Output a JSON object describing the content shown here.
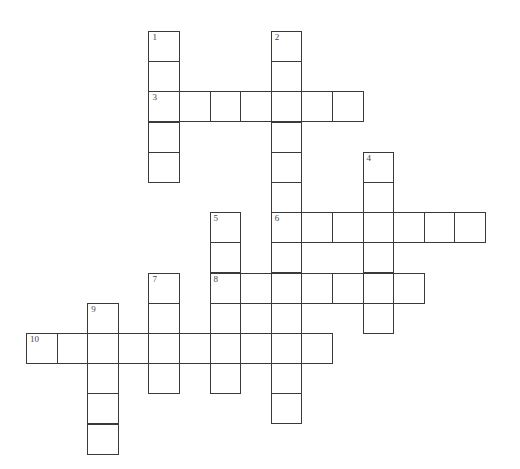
{
  "puzzle": {
    "type": "crossword",
    "cell_size": 30.6,
    "origin": {
      "x": 26,
      "y": 31
    },
    "row_step": 30.2,
    "border_color": "#3a3a3a",
    "words": [
      {
        "number": "1",
        "direction": "down",
        "row": 0,
        "col": 4,
        "length": 5
      },
      {
        "number": "2",
        "direction": "down",
        "row": 0,
        "col": 8,
        "length": 13
      },
      {
        "number": "3",
        "direction": "across",
        "row": 2,
        "col": 4,
        "length": 7
      },
      {
        "number": "4",
        "direction": "down",
        "row": 4,
        "col": 11,
        "length": 6
      },
      {
        "number": "5",
        "direction": "down",
        "row": 6,
        "col": 6,
        "length": 6
      },
      {
        "number": "6",
        "direction": "across",
        "row": 6,
        "col": 8,
        "length": 7
      },
      {
        "number": "7",
        "direction": "down",
        "row": 8,
        "col": 4,
        "length": 4
      },
      {
        "number": "8",
        "direction": "across",
        "row": 8,
        "col": 6,
        "length": 7
      },
      {
        "number": "9",
        "direction": "down",
        "row": 9,
        "col": 2,
        "length": 5
      },
      {
        "number": "10",
        "direction": "across",
        "row": 10,
        "col": 0,
        "length": 10
      }
    ]
  }
}
